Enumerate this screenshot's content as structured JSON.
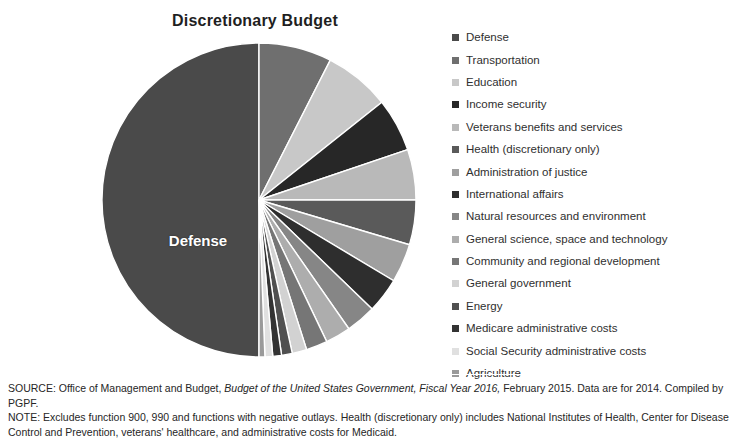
{
  "chart_title": "Discretionary Budget",
  "pie_center_label": "Defense",
  "legend": {
    "items": [
      {
        "label": "Defense",
        "color": "#4a4a4a"
      },
      {
        "label": "Transportation",
        "color": "#6f6f6f"
      },
      {
        "label": "Education",
        "color": "#c8c8c8"
      },
      {
        "label": "Income security",
        "color": "#272727"
      },
      {
        "label": "Veterans benefits and services",
        "color": "#b9b9b9"
      },
      {
        "label": "Health (discretionary only)",
        "color": "#5a5a5a"
      },
      {
        "label": "Administration of justice",
        "color": "#9f9f9f"
      },
      {
        "label": "International affairs",
        "color": "#2e2e2e"
      },
      {
        "label": "Natural resources and environment",
        "color": "#868686"
      },
      {
        "label": "General science, space and technology",
        "color": "#adadad"
      },
      {
        "label": "Community and regional development",
        "color": "#767676"
      },
      {
        "label": "General government",
        "color": "#d2d2d2"
      },
      {
        "label": "Energy",
        "color": "#505050"
      },
      {
        "label": "Medicare administrative costs",
        "color": "#333333"
      },
      {
        "label": "Social Security administrative costs",
        "color": "#e0e0e0"
      },
      {
        "label": "Agriculture",
        "color": "#9a9a9a"
      }
    ]
  },
  "footnote": {
    "source_prefix": "SOURCE: Office of Management and Budget, ",
    "source_italic": "Budget of the United States Government, Fiscal Year 2016,",
    "source_suffix": " February 2015. Data are for 2014. Compiled by PGPF.",
    "note": "NOTE: Excludes function 900, 990 and functions with negative outlays. Health (discretionary only) includes National Institutes of Health, Center for Disease Control and Prevention, veterans' healthcare, and administrative costs for Medicaid."
  },
  "chart_data": {
    "type": "pie",
    "title": "Discretionary Budget",
    "legend_position": "right",
    "units": "percent of discretionary budget",
    "start_angle_deg": 0,
    "direction": "clockwise",
    "categories": [
      "Defense",
      "Transportation",
      "Education",
      "Income security",
      "Veterans benefits and services",
      "Health (discretionary only)",
      "Administration of justice",
      "International affairs",
      "Natural resources and environment",
      "General science, space and technology",
      "Community and regional development",
      "General government",
      "Energy",
      "Medicare administrative costs",
      "Social Security administrative costs",
      "Agriculture"
    ],
    "values": [
      50.0,
      7.5,
      6.8,
      5.5,
      5.2,
      4.6,
      4.0,
      3.6,
      3.1,
      2.6,
      2.2,
      1.5,
      1.1,
      0.9,
      0.8,
      0.6
    ],
    "colors": [
      "#4a4a4a",
      "#6f6f6f",
      "#c8c8c8",
      "#272727",
      "#b9b9b9",
      "#5a5a5a",
      "#9f9f9f",
      "#2e2e2e",
      "#868686",
      "#adadad",
      "#767676",
      "#d2d2d2",
      "#505050",
      "#333333",
      "#e0e0e0",
      "#9a9a9a"
    ],
    "labeled_slices": [
      {
        "name": "Defense",
        "label_inside": "Defense"
      }
    ]
  }
}
